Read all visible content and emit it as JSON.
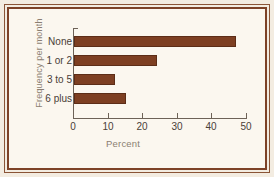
{
  "figure": {
    "background_color": "#fbf7ef",
    "frame_color": "#7d4227",
    "bar_color": "#7d3f22"
  },
  "chart_data": {
    "type": "bar",
    "orientation": "horizontal",
    "title": "",
    "categories": [
      "None",
      "1 or 2",
      "3 to 5",
      "6 plus"
    ],
    "values": [
      47,
      24,
      12,
      15
    ],
    "xlabel": "Percent",
    "ylabel": "Frequency per month",
    "xlim": [
      0,
      50
    ],
    "xticks": [
      0,
      10,
      20,
      30,
      40,
      50
    ],
    "xticklabels": [
      "0",
      "10",
      "20",
      "30",
      "40",
      "50"
    ],
    "grid": false,
    "legend": false
  }
}
